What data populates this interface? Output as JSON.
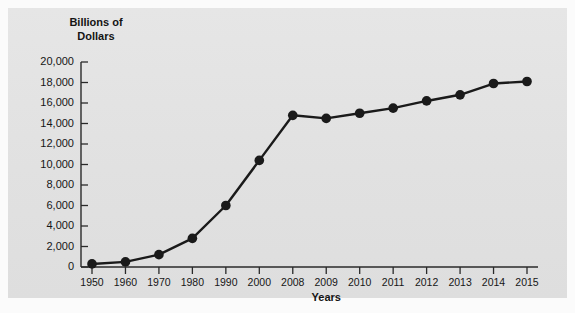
{
  "figure": {
    "background_color": "#fbfbfb",
    "panel_color": "#e3e3e3"
  },
  "chart_data": {
    "type": "line",
    "title": "",
    "ylabel_line1": "Billions of",
    "ylabel_line2": "Dollars",
    "xlabel": "Years",
    "categories": [
      "1950",
      "1960",
      "1970",
      "1980",
      "1990",
      "2000",
      "2008",
      "2009",
      "2010",
      "2011",
      "2012",
      "2013",
      "2014",
      "2015"
    ],
    "values": [
      300,
      500,
      1200,
      2800,
      6000,
      10400,
      14800,
      14500,
      15000,
      15500,
      16200,
      16800,
      17900,
      18100
    ],
    "yticks": [
      "0",
      "2,000",
      "4,000",
      "6,000",
      "8,000",
      "10,000",
      "12,000",
      "14,000",
      "16,000",
      "18,000",
      "20,000"
    ],
    "ytick_values": [
      0,
      2000,
      4000,
      6000,
      8000,
      10000,
      12000,
      14000,
      16000,
      18000,
      20000
    ],
    "ylim": [
      0,
      20000
    ],
    "grid": false,
    "legend": "none",
    "series_color": "#1a1a1a",
    "marker": "circle",
    "marker_size": 7
  }
}
